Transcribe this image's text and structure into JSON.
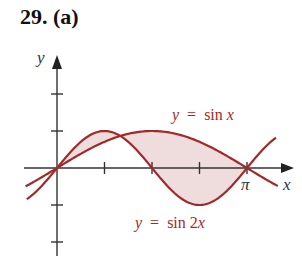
{
  "problem": {
    "label": "29. (a)"
  },
  "chart_data": {
    "type": "line",
    "title": "29. (a)",
    "xlabel": "x",
    "ylabel": "y",
    "x_tick_labels": [
      {
        "value": 3.14159,
        "label": "π"
      }
    ],
    "x_ticks": [
      0.7854,
      1.5708,
      2.3562,
      3.14159
    ],
    "y_ticks": [
      -2,
      -1,
      1,
      2
    ],
    "xlim": [
      -0.5,
      3.65
    ],
    "ylim": [
      -2.3,
      3
    ],
    "series": [
      {
        "name": "y = sin x",
        "function": "sin(x)",
        "color": "#a3282a"
      },
      {
        "name": "y = sin 2x",
        "function": "sin(2x)",
        "color": "#a3282a"
      }
    ],
    "shaded_region": {
      "between": [
        "sin x",
        "sin 2x"
      ],
      "x_range": [
        0,
        3.14159
      ],
      "color": "#efdcdd"
    },
    "annotations": [
      {
        "text": "y = sin x",
        "near": "sin x curve, upper right"
      },
      {
        "text": "y = sin 2x",
        "near": "sin 2x curve, bottom"
      }
    ]
  },
  "labels": {
    "y_axis": "y",
    "x_axis": "x",
    "pi": "π",
    "sinx_y": "y",
    "sinx_eq": "=",
    "sinx_fn": "sin",
    "sinx_var": "x",
    "sin2x_y": "y",
    "sin2x_eq": "=",
    "sin2x_fn": "sin 2",
    "sin2x_var": "x"
  }
}
